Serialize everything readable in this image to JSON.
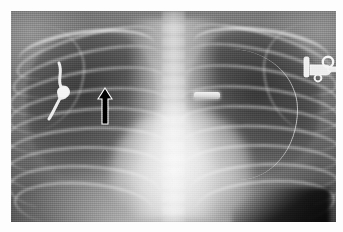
{
  "figure": {
    "kind": "radiograph",
    "modality": "X-ray",
    "view": "chest-frontal-ap",
    "title": "Chest radiograph",
    "colors": {
      "paper_border": "#ffffff",
      "film_dark": "#2d2d2d",
      "film_mid": "#6e6e6e",
      "bone_bright": "#f2f2f2",
      "annotation_arrow": "#000000",
      "annotation_outline": "#ffffff"
    },
    "frame": {
      "border_left_px": 11,
      "border_top_px": 11,
      "border_right_px": 7,
      "border_bottom_px": 10,
      "film_width_px": 325,
      "film_height_px": 211
    }
  },
  "annotations": [
    {
      "id": "arrow-up",
      "name": "arrow-annotation",
      "glyph": "↑",
      "color": "#000000",
      "outline": "#ffffff",
      "direction": "up",
      "x_px": 86,
      "y_px": 76,
      "width_px": 16,
      "height_px": 38,
      "points_to": "right upper lung zone opacity"
    }
  ],
  "devices": [
    {
      "id": "device-left-hub",
      "name": "implanted-port-hub",
      "side": "patient-left",
      "x_px": 287,
      "y_px": 40,
      "width_px": 46,
      "height_px": 34,
      "radiopaque": true
    },
    {
      "id": "device-right-coil",
      "name": "catheter-coil",
      "side": "patient-right",
      "x_px": 34,
      "y_px": 50,
      "width_px": 34,
      "height_px": 60,
      "radiopaque": true
    },
    {
      "id": "device-center-marker",
      "name": "radiopaque-marker",
      "side": "midline",
      "x_px": 183,
      "y_px": 81,
      "width_px": 26,
      "height_px": 7,
      "radiopaque": true
    },
    {
      "id": "device-catheter-line",
      "name": "catheter-line",
      "side": "patient-left",
      "radiopaque": true
    }
  ],
  "anatomy": [
    {
      "id": "lung-right",
      "name": "right-lung-field",
      "side": "patient-right"
    },
    {
      "id": "lung-left",
      "name": "left-lung-field",
      "side": "patient-left"
    },
    {
      "id": "mediastinum",
      "name": "mediastinum"
    },
    {
      "id": "cardiac-silhouette",
      "name": "cardiac-silhouette"
    },
    {
      "id": "diaphragm",
      "name": "diaphragm"
    },
    {
      "id": "gastric-bubble",
      "name": "gastric-gas-bubble"
    },
    {
      "id": "spine",
      "name": "thoracic-spine"
    },
    {
      "id": "clavicle-right",
      "name": "right-clavicle"
    },
    {
      "id": "clavicle-left",
      "name": "left-clavicle"
    },
    {
      "id": "ribs",
      "name": "rib-cage",
      "right_count": 9,
      "left_count": 9
    }
  ],
  "ribs_right": [
    {
      "left": "1%",
      "top": "11%",
      "width": "44%",
      "height": "16%",
      "rot": -16
    },
    {
      "left": "0%",
      "top": "19%",
      "width": "46%",
      "height": "18%",
      "rot": -13
    },
    {
      "left": "-1%",
      "top": "28%",
      "width": "48%",
      "height": "19%",
      "rot": -10
    },
    {
      "left": "-1%",
      "top": "37%",
      "width": "49%",
      "height": "20%",
      "rot": -7
    },
    {
      "left": "-2%",
      "top": "46%",
      "width": "50%",
      "height": "21%",
      "rot": -5
    },
    {
      "left": "-2%",
      "top": "55%",
      "width": "50%",
      "height": "22%",
      "rot": -3
    },
    {
      "left": "-2%",
      "top": "64%",
      "width": "49%",
      "height": "22%",
      "rot": -1
    },
    {
      "left": "-1%",
      "top": "73%",
      "width": "46%",
      "height": "22%",
      "rot": 2
    },
    {
      "left": "1%",
      "top": "81%",
      "width": "42%",
      "height": "21%",
      "rot": 4
    }
  ],
  "ribs_left": [
    {
      "left": "55%",
      "top": "10%",
      "width": "44%",
      "height": "16%",
      "rot": 16
    },
    {
      "left": "54%",
      "top": "18%",
      "width": "46%",
      "height": "18%",
      "rot": 13
    },
    {
      "left": "53%",
      "top": "27%",
      "width": "48%",
      "height": "19%",
      "rot": 10
    },
    {
      "left": "52%",
      "top": "36%",
      "width": "49%",
      "height": "20%",
      "rot": 7
    },
    {
      "left": "52%",
      "top": "45%",
      "width": "50%",
      "height": "21%",
      "rot": 5
    },
    {
      "left": "52%",
      "top": "54%",
      "width": "50%",
      "height": "22%",
      "rot": 3
    },
    {
      "left": "53%",
      "top": "63%",
      "width": "49%",
      "height": "22%",
      "rot": 1
    },
    {
      "left": "55%",
      "top": "72%",
      "width": "46%",
      "height": "22%",
      "rot": -2
    },
    {
      "left": "57%",
      "top": "80%",
      "width": "42%",
      "height": "21%",
      "rot": -4
    }
  ]
}
